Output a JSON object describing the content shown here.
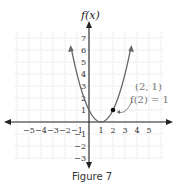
{
  "chart_data": {
    "type": "line",
    "title": "f(x)",
    "xlabel": "",
    "ylabel": "f(x)",
    "xlim": [
      -6,
      6
    ],
    "ylim": [
      -3,
      7
    ],
    "grid": true,
    "xticks": [
      "−5",
      "−4",
      "−3",
      "−2",
      "−1",
      "1",
      "2",
      "3",
      "4",
      "5"
    ],
    "xtick_values": [
      -5,
      -4,
      -3,
      -2,
      -1,
      1,
      2,
      3,
      4,
      5
    ],
    "yticks": [
      "7",
      "6",
      "5",
      "4",
      "3",
      "2",
      "1",
      "−1",
      "−2",
      "−3"
    ],
    "ytick_values": [
      7,
      6,
      5,
      4,
      3,
      2,
      1,
      -1,
      -2,
      -3
    ],
    "series": [
      {
        "name": "f(x) = (x−1)^2",
        "x": [
          -1.45,
          -1,
          -0.5,
          0,
          0.5,
          1,
          1.5,
          2,
          2.5,
          3,
          3.45
        ],
        "values": [
          6,
          4,
          2.25,
          1,
          0.25,
          0,
          0.25,
          1,
          2.25,
          4,
          6
        ]
      }
    ],
    "highlight_point": {
      "x": 2,
      "y": 1
    },
    "annotations": [
      "(2, 1)",
      "f(2) = 1"
    ]
  },
  "labels": {
    "y_axis_title": "f(x)",
    "point_label": "(2, 1)",
    "point_equation": "f(2) = 1",
    "caption": "Figure 7"
  }
}
